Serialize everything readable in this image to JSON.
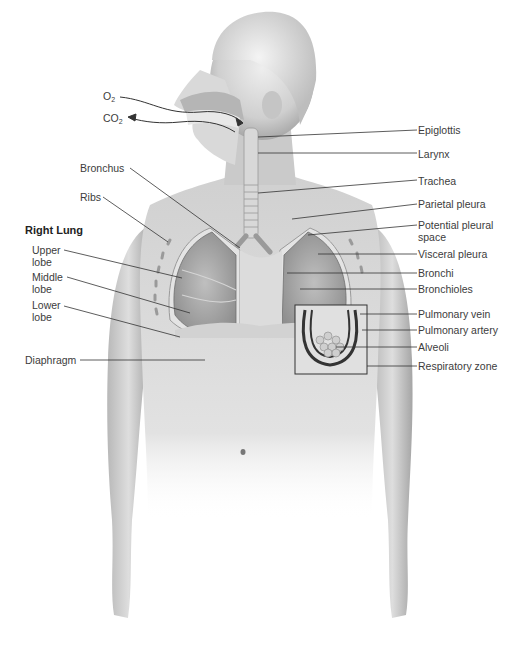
{
  "diagram": {
    "gas_labels": {
      "o2": {
        "base": "O",
        "sub": "2"
      },
      "co2": {
        "base": "CO",
        "sub": "2"
      }
    },
    "left_labels": {
      "bronchus": "Bronchus",
      "ribs": "Ribs",
      "right_lung_heading": "Right Lung",
      "upper_lobe": "Upper lobe",
      "middle_lobe": "Middle lobe",
      "lower_lobe": "Lower lobe",
      "diaphragm": "Diaphragm"
    },
    "right_labels": {
      "epiglottis": "Epiglottis",
      "larynx": "Larynx",
      "trachea": "Trachea",
      "parietal_pleura": "Parietal pleura",
      "potential_pleural_space": "Potential pleural space",
      "visceral_pleura": "Visceral pleura",
      "bronchi": "Bronchi",
      "bronchioles": "Bronchioles",
      "pulmonary_vein": "Pulmonary vein",
      "pulmonary_artery": "Pulmonary artery",
      "alveoli": "Alveoli",
      "respiratory_zone": "Respiratory zone"
    },
    "colors": {
      "skin_light": "#e6e6e6",
      "skin_mid": "#bdbdbd",
      "skin_dark": "#8c8c8c",
      "lung": "#a9a9a9",
      "line": "#333333"
    }
  }
}
